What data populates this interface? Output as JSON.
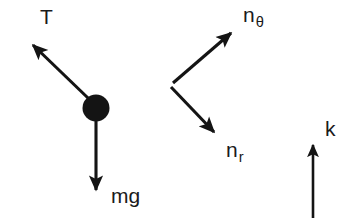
{
  "figure": {
    "type": "free-body-diagram",
    "width": 353,
    "height": 223,
    "background_color": "#ffffff",
    "stroke_color": "#1a1a1a"
  },
  "labels": {
    "tension": "T",
    "weight": "mg",
    "unit_theta_base": "n",
    "unit_theta_sub": "θ",
    "unit_r_base": "n",
    "unit_r_sub": "r",
    "unit_k": "k"
  },
  "elements": {
    "bob": {
      "name": "particle-bob",
      "cx": 96,
      "cy": 108,
      "r": 13.5,
      "fill": "#141414"
    },
    "arrows": [
      {
        "name": "tension-arrow",
        "label": "T",
        "x1": 88,
        "y1": 98,
        "x2": 31,
        "y2": 43,
        "direction": "up-left"
      },
      {
        "name": "weight-arrow",
        "label": "mg",
        "x1": 96,
        "y1": 119,
        "x2": 96,
        "y2": 196,
        "direction": "down"
      },
      {
        "name": "unit-theta-arrow",
        "label": "nθ",
        "x1": 173,
        "y1": 83,
        "x2": 235,
        "y2": 29,
        "direction": "up-right"
      },
      {
        "name": "unit-r-arrow",
        "label": "nr",
        "x1": 171,
        "y1": 87,
        "x2": 218,
        "y2": 137,
        "direction": "down-right"
      },
      {
        "name": "unit-k-arrow",
        "label": "k",
        "x1": 313,
        "y1": 218,
        "x2": 313,
        "y2": 139,
        "direction": "up"
      }
    ]
  }
}
